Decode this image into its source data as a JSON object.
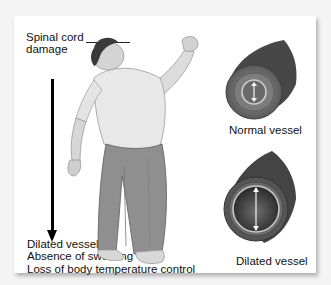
{
  "figure": {
    "cause_label_line1": "Spinal cord",
    "cause_label_line2": "damage",
    "effects": [
      "Dilated vessels",
      "Absence of sweating",
      "Loss of body temperature control"
    ],
    "vessels": {
      "normal_caption": "Normal vessel",
      "dilated_caption": "Dilated vessel"
    },
    "icons": {
      "person": "collapsing-person-illustration",
      "normal": "normal-vessel-cross-section",
      "dilated": "dilated-vessel-cross-section",
      "arrow": "down-arrow"
    },
    "colors": {
      "background": "#f4f4f4",
      "panel": "#ffffff",
      "text": "#111111",
      "vessel_outer": "#4a4a4a",
      "vessel_inner": "#8a8a8a",
      "skin": "#d8d8d8",
      "shirt": "#e6e6e6",
      "pants": "#8c8c8c"
    }
  }
}
